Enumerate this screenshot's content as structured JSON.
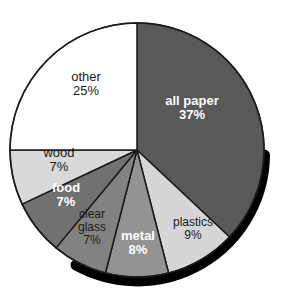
{
  "figure": {
    "title_remnant": "",
    "background_color": "#ffffff"
  },
  "chart_data": {
    "type": "pie",
    "title": "",
    "subtitle": "",
    "xlabel": "",
    "ylabel": "",
    "legend_position": "none",
    "grid": false,
    "units": "percent",
    "value_suffix": "%",
    "start_angle_deg": 0,
    "direction": "clockwise",
    "total": 100,
    "categories": [
      "all paper",
      "plastics",
      "metal",
      "clear glass",
      "food",
      "wood",
      "other"
    ],
    "values": [
      37,
      9,
      8,
      7,
      7,
      7,
      25
    ],
    "slices": [
      {
        "label": "all paper",
        "value": 37,
        "value_text": "37%",
        "fill": "#595959",
        "text_color": "#ffffff",
        "text_weight": "bold",
        "start_deg": 0,
        "end_deg": 133.2
      },
      {
        "label": "plastics",
        "value": 9,
        "value_text": "9%",
        "fill": "#d6d6d6",
        "text_color": "#1a1a1a",
        "text_weight": "normal",
        "start_deg": 133.2,
        "end_deg": 165.6
      },
      {
        "label": "metal",
        "value": 8,
        "value_text": "8%",
        "fill": "#939393",
        "text_color": "#ffffff",
        "text_weight": "bold",
        "start_deg": 165.6,
        "end_deg": 194.4
      },
      {
        "label": "clear glass",
        "value": 7,
        "value_text": "7%",
        "fill": "#828282",
        "text_color": "#1a1a1a",
        "text_weight": "normal",
        "start_deg": 194.4,
        "end_deg": 219.6
      },
      {
        "label": "food",
        "value": 7,
        "value_text": "7%",
        "fill": "#717171",
        "text_color": "#ffffff",
        "text_weight": "bold",
        "start_deg": 219.6,
        "end_deg": 244.8
      },
      {
        "label": "wood",
        "value": 7,
        "value_text": "7%",
        "fill": "#d9d9d9",
        "text_color": "#1a1a1a",
        "text_weight": "normal",
        "start_deg": 244.8,
        "end_deg": 270.0
      },
      {
        "label": "other",
        "value": 25,
        "value_text": "25%",
        "fill": "#ffffff",
        "text_color": "#1a1a1a",
        "text_weight": "normal",
        "start_deg": 270.0,
        "end_deg": 360.0
      }
    ],
    "style": {
      "outline_color": "#1a1a1a",
      "outline_width": 1.5,
      "shadow_color": "#000000",
      "shadow_width": 9
    }
  },
  "labels": {
    "all_paper": {
      "name": "all paper",
      "value": "37%"
    },
    "plastics": {
      "name": "plastics",
      "value": "9%"
    },
    "metal": {
      "name": "metal",
      "value": "8%"
    },
    "clear_glass": {
      "name_line1": "clear",
      "name_line2": "glass",
      "value": "7%"
    },
    "food": {
      "name": "food",
      "value": "7%"
    },
    "wood": {
      "name": "wood",
      "value": "7%"
    },
    "other": {
      "name": "other",
      "value": "25%"
    }
  }
}
